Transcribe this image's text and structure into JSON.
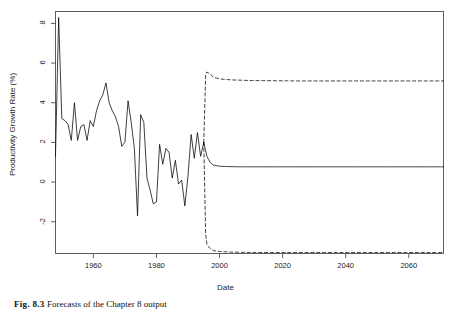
{
  "figure": {
    "caption_label": "Fig. 8.3",
    "caption_text": "Forecasts of the Chapter 8 output"
  },
  "chart_data": {
    "type": "line",
    "title": "",
    "xlabel": "Date",
    "ylabel": "Productivity Growth Rate (%)",
    "xlim": [
      1948,
      2071
    ],
    "ylim": [
      -3.6,
      8.6
    ],
    "xticks": [
      1960,
      1980,
      2000,
      2020,
      2040,
      2060
    ],
    "xtick_labels": [
      "1960",
      "1980",
      "2000",
      "2020",
      "2040",
      "2060"
    ],
    "yticks": [
      -2,
      0,
      2,
      4,
      6,
      8
    ],
    "ytick_labels": [
      "-2",
      "0",
      "2",
      "4",
      "6",
      "8"
    ],
    "grid": false,
    "legend": "none",
    "box": true,
    "forecast_start": 1995,
    "series": [
      {
        "name": "Observed productivity growth rate",
        "style": "solid",
        "color": "#000000",
        "x": [
          1948,
          1949,
          1950,
          1951,
          1952,
          1953,
          1954,
          1955,
          1956,
          1957,
          1958,
          1959,
          1960,
          1961,
          1962,
          1963,
          1964,
          1965,
          1966,
          1967,
          1968,
          1969,
          1970,
          1971,
          1972,
          1973,
          1974,
          1975,
          1976,
          1977,
          1978,
          1979,
          1980,
          1981,
          1982,
          1983,
          1984,
          1985,
          1986,
          1987,
          1988,
          1989,
          1990,
          1991,
          1992,
          1993,
          1994,
          1995
        ],
        "y": [
          1.3,
          8.3,
          3.2,
          3.1,
          2.9,
          2.1,
          4.0,
          2.1,
          2.8,
          2.9,
          2.1,
          3.1,
          2.8,
          3.6,
          4.1,
          4.4,
          5.0,
          4.0,
          3.6,
          3.3,
          2.8,
          1.8,
          2.0,
          4.1,
          3.0,
          1.7,
          -1.7,
          3.4,
          3.0,
          0.2,
          -0.4,
          -1.1,
          -1.0,
          1.9,
          0.9,
          1.7,
          1.5,
          0.2,
          1.1,
          -0.1,
          0.1,
          -1.2,
          0.3,
          2.4,
          1.2,
          2.5,
          1.3,
          2.0
        ]
      },
      {
        "name": "Point forecast",
        "style": "solid",
        "color": "#000000",
        "x": [
          1995,
          1996,
          1997,
          1998,
          2000,
          2003,
          2007,
          2015,
          2030,
          2050,
          2071
        ],
        "y": [
          2.0,
          1.3,
          1.0,
          0.86,
          0.8,
          0.78,
          0.77,
          0.77,
          0.77,
          0.77,
          0.77
        ]
      },
      {
        "name": "Upper 95% prediction interval",
        "style": "dashed",
        "color": "#000000",
        "x": [
          1995,
          1995.6,
          1996,
          1997,
          1998,
          2000,
          2004,
          2010,
          2025,
          2045,
          2071
        ],
        "y": [
          2.0,
          5.4,
          5.55,
          5.45,
          5.3,
          5.2,
          5.15,
          5.12,
          5.1,
          5.1,
          5.1
        ]
      },
      {
        "name": "Lower 95% prediction interval",
        "style": "dashed",
        "color": "#000000",
        "x": [
          1995,
          1995.6,
          1996,
          1997,
          1998,
          2000,
          2004,
          2010,
          2025,
          2045,
          2071
        ],
        "y": [
          2.0,
          -2.6,
          -3.15,
          -3.35,
          -3.45,
          -3.5,
          -3.53,
          -3.55,
          -3.55,
          -3.55,
          -3.55
        ]
      }
    ]
  }
}
